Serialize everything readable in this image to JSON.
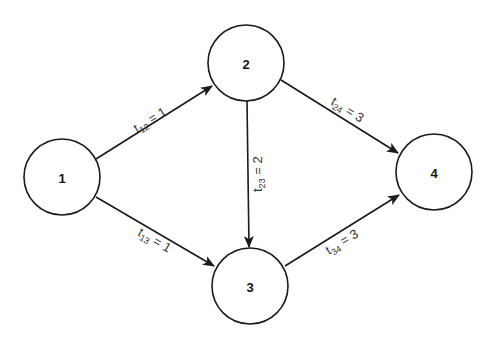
{
  "diagram": {
    "type": "directed-network",
    "nodes": [
      {
        "id": "1",
        "label": "1",
        "cx": 62,
        "cy": 177,
        "r": 38
      },
      {
        "id": "2",
        "label": "2",
        "cx": 246,
        "cy": 63,
        "r": 38
      },
      {
        "id": "3",
        "label": "3",
        "cx": 250,
        "cy": 286,
        "r": 38
      },
      {
        "id": "4",
        "label": "4",
        "cx": 434,
        "cy": 172,
        "r": 38
      }
    ],
    "edges": [
      {
        "from": "1",
        "to": "2",
        "var": "t",
        "sub": "12",
        "eq": " = 1",
        "value": 1
      },
      {
        "from": "1",
        "to": "3",
        "var": "t",
        "sub": "13",
        "eq": " = 1",
        "value": 1
      },
      {
        "from": "2",
        "to": "3",
        "var": "t",
        "sub": "23",
        "eq": " = 2",
        "value": 2
      },
      {
        "from": "2",
        "to": "4",
        "var": "t",
        "sub": "24",
        "eq": " = 3",
        "value": 3
      },
      {
        "from": "3",
        "to": "4",
        "var": "t",
        "sub": "34",
        "eq": " = 3",
        "value": 3
      }
    ],
    "colors": {
      "stroke": "#1a1a1a",
      "label": "#333333",
      "background": "#ffffff"
    }
  }
}
